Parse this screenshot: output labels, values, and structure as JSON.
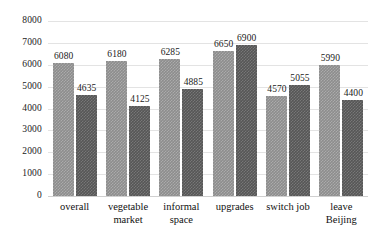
{
  "chart_data": {
    "type": "bar",
    "title": "",
    "subtitle": "",
    "xlabel": "",
    "ylabel": "",
    "ylim": [
      0,
      8000
    ],
    "ytick_labels": [
      "8000",
      "7000",
      "6000",
      "5000",
      "4000",
      "3000",
      "2000",
      "1000",
      "0"
    ],
    "ytick_values": [
      8000,
      7000,
      6000,
      5000,
      4000,
      3000,
      2000,
      1000,
      0
    ],
    "grid": true,
    "legend": "none",
    "categories": [
      "overall",
      "vegetable\nmarket",
      "informal\nspace",
      "upgrades",
      "switch job",
      "leave\nBeijing"
    ],
    "series": [
      {
        "name": "series-1",
        "color": "#8d8d8d",
        "values": [
          6080,
          6180,
          6285,
          6650,
          4570,
          5990
        ],
        "labels": [
          "6080",
          "6180",
          "6285",
          "6650",
          "4570",
          "5990"
        ]
      },
      {
        "name": "series-2",
        "color": "#565656",
        "values": [
          4635,
          4125,
          4885,
          6900,
          5055,
          4400
        ],
        "labels": [
          "4635",
          "4125",
          "4885",
          "6900",
          "5055",
          "4400"
        ]
      }
    ]
  },
  "style": {
    "gridline_color": "#e3e3e3",
    "baseline_color": "#d0d0d0",
    "text_color": "#1a1a1a",
    "background": "#ffffff"
  }
}
